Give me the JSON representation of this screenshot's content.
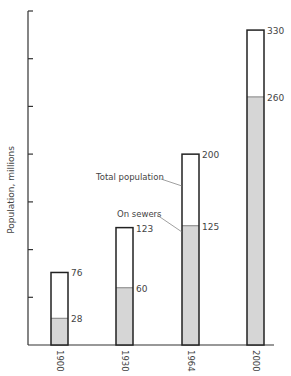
{
  "chart_data": {
    "type": "bar",
    "title": "",
    "xlabel": "",
    "ylabel": "Population, millions",
    "ylim": [
      0,
      350
    ],
    "y_tick_interval": 50,
    "y_tick_labels_shown": false,
    "grid": false,
    "categories": [
      "1900",
      "1930",
      "1964",
      "2000"
    ],
    "series": [
      {
        "name": "Total population",
        "values": [
          76,
          123,
          200,
          330
        ],
        "fill": "#ffffff"
      },
      {
        "name": "On sewers",
        "values": [
          28,
          60,
          125,
          260
        ],
        "fill": "#d9d9d9"
      }
    ],
    "annotations": [
      {
        "text": "Total population",
        "points_to": "1964 total bar"
      },
      {
        "text": "On sewers",
        "points_to": "1964 on-sewers segment"
      }
    ],
    "stacking": "overlaid (on-sewers is a subset shaded at base of total bar)"
  },
  "labels": {
    "ylabel": "Population, millions",
    "annot_total": "Total population",
    "annot_sewers": "On sewers",
    "x": [
      "1900",
      "1930",
      "1964",
      "2000"
    ],
    "total": [
      "76",
      "123",
      "200",
      "330"
    ],
    "sewers": [
      "28",
      "60",
      "125",
      "260"
    ]
  },
  "colors": {
    "axis": "#333333",
    "bar_outline": "#222222",
    "shade": "#d6d6d6",
    "text": "#444444"
  }
}
